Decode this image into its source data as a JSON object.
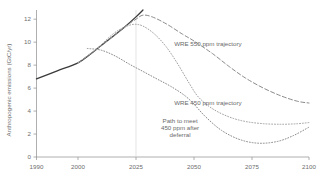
{
  "chart_data": {
    "type": "line",
    "title": "",
    "xlabel": "",
    "ylabel": "Anthropogenic emissions (GtC/yr)",
    "xlim": [
      1990,
      2100
    ],
    "ylim": [
      0,
      12.8
    ],
    "grid": false,
    "legend_position": "inline-annotations",
    "xticks": [
      1990,
      2000,
      2025,
      2050,
      2075,
      2100
    ],
    "xtick_labels": [
      "1990",
      "2000",
      "2025",
      "2050",
      "2075",
      "2100"
    ],
    "yticks": [
      0,
      2,
      4,
      6,
      8,
      10,
      12
    ],
    "ytick_labels": [
      "0",
      "2",
      "4",
      "6",
      "8",
      "10",
      "12"
    ],
    "reference_lines": [
      {
        "name": "year-2025-marker",
        "orientation": "vertical",
        "x": 2025,
        "color": "#d8d8d8"
      }
    ],
    "series": [
      {
        "name": "Baseline emissions path",
        "style": "solid",
        "color": "#3a3a3a",
        "width": 1.3,
        "x": [
          1990,
          1995,
          2000,
          2005,
          2010,
          2015,
          2020,
          2025,
          2028
        ],
        "values": [
          6.8,
          7.5,
          8.2,
          8.9,
          9.7,
          10.5,
          11.3,
          12.2,
          12.8
        ]
      },
      {
        "name": "WRE 550 ppm trajectory",
        "style": "dashed",
        "color": "#8a8a8a",
        "width": 1.0,
        "x": [
          2000,
          2010,
          2020,
          2025,
          2028,
          2032,
          2038,
          2045,
          2050,
          2058,
          2065,
          2072,
          2080,
          2088,
          2095,
          2100
        ],
        "values": [
          8.2,
          9.7,
          11.3,
          12.0,
          12.35,
          12.2,
          11.6,
          10.7,
          10.1,
          9.0,
          7.9,
          6.9,
          6.0,
          5.3,
          4.85,
          4.7
        ]
      },
      {
        "name": "WRE 450 ppm trajectory",
        "style": "dotted",
        "color": "#a0a0a0",
        "width": 1.0,
        "x": [
          2000,
          2008,
          2015,
          2020,
          2024,
          2028,
          2033,
          2038,
          2043,
          2048,
          2052,
          2058,
          2065,
          2072,
          2080,
          2088,
          2095,
          2100
        ],
        "values": [
          8.2,
          9.4,
          10.7,
          11.3,
          11.55,
          11.4,
          10.7,
          9.6,
          8.1,
          6.4,
          5.2,
          4.2,
          3.5,
          3.1,
          2.9,
          2.85,
          2.9,
          3.0
        ]
      },
      {
        "name": "Path to meet 450 ppm after deferral",
        "style": "dotted",
        "color": "#8a8a8a",
        "width": 1.0,
        "x": [
          2004,
          2010,
          2016,
          2022,
          2028,
          2034,
          2040,
          2046,
          2050,
          2055,
          2062,
          2070,
          2078,
          2086,
          2093,
          2100
        ],
        "values": [
          9.45,
          9.3,
          8.8,
          8.1,
          7.45,
          6.8,
          6.15,
          5.35,
          4.6,
          3.5,
          2.3,
          1.5,
          1.2,
          1.35,
          1.85,
          2.6
        ]
      }
    ],
    "annotations": [
      {
        "name": "wre-550-label",
        "text": "WRE 550 ppm trajectory",
        "x": 2056,
        "y": 9.7
      },
      {
        "name": "wre-450-label",
        "text": "WRE 450 ppm trajectory",
        "x": 2056,
        "y": 4.55
      },
      {
        "name": "deferral-label-line1",
        "text": "Path to meet",
        "x": 2044,
        "y": 2.95
      },
      {
        "name": "deferral-label-line2",
        "text": "450 ppm after",
        "x": 2044,
        "y": 2.33
      },
      {
        "name": "deferral-label-line3",
        "text": "deferral",
        "x": 2044,
        "y": 1.71
      }
    ]
  }
}
